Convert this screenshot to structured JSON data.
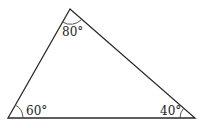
{
  "diagram": {
    "type": "triangle",
    "vertices": {
      "top": {
        "x": 70,
        "y": 9
      },
      "bottom_left": {
        "x": 8,
        "y": 118
      },
      "bottom_right": {
        "x": 195,
        "y": 118
      }
    },
    "angles": {
      "top": "80°",
      "bottom_left": "60°",
      "bottom_right": "40°"
    },
    "colors": {
      "stroke": "#2a2a2a",
      "text": "#222222",
      "background": "#ffffff"
    }
  }
}
